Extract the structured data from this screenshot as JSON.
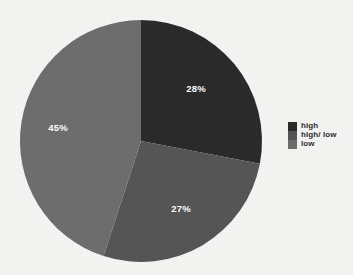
{
  "background_color": "#f5f5f4",
  "chart_data": {
    "type": "pie",
    "title": "",
    "subtitle": "",
    "xlabel": "",
    "ylabel": "",
    "grid": false,
    "legend_position": "right",
    "start_angle_deg": 0,
    "direction": "clockwise",
    "center": {
      "x": 141,
      "y": 141
    },
    "radius": 121,
    "categories": [
      "high",
      "high/ low",
      "low"
    ],
    "values": [
      28,
      27,
      45
    ],
    "value_unit": "%",
    "data_labels": [
      "28%",
      "27%",
      "45%"
    ],
    "colors": [
      "#2b2b2b",
      "#565656",
      "#6e6e6e"
    ],
    "slices": [
      {
        "name": "high",
        "value": 28,
        "label": "28%",
        "color": "#2b2b2b",
        "label_x": 196,
        "label_y": 92
      },
      {
        "name": "high/ low",
        "value": 27,
        "label": "27%",
        "color": "#565656",
        "label_x": 181,
        "label_y": 212
      },
      {
        "name": "low",
        "value": 45,
        "label": "45%",
        "color": "#6e6e6e",
        "label_x": 58,
        "label_y": 131
      }
    ]
  },
  "legend": {
    "items": [
      {
        "label": "high",
        "color": "#2b2b2b"
      },
      {
        "label": "high/ low",
        "color": "#565656"
      },
      {
        "label": "low",
        "color": "#6e6e6e"
      }
    ]
  }
}
